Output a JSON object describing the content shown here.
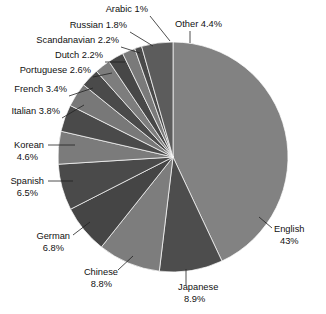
{
  "chart_data": {
    "type": "pie",
    "title": "",
    "subtitle": "",
    "xlabel": "",
    "ylabel": "",
    "legend_position": "outside-labels",
    "grid": false,
    "start_angle_deg": 0,
    "direction": "clockwise",
    "categories": [
      "English",
      "Japanese",
      "Chinese",
      "German",
      "Spanish",
      "Korean",
      "Italian",
      "French",
      "Portuguese",
      "Dutch",
      "Scandanavian",
      "Russian",
      "Arabic",
      "Other"
    ],
    "values": [
      43,
      8.9,
      8.8,
      6.8,
      6.5,
      4.6,
      3.8,
      3.4,
      2.6,
      2.2,
      2.2,
      1.8,
      1,
      4.4
    ],
    "value_unit": "%",
    "total": 100.0,
    "slices": [
      {
        "name": "English",
        "value": 43,
        "value_text": "43%",
        "label_line1": "English",
        "label_line2": "43%",
        "color": "#828282"
      },
      {
        "name": "Japanese",
        "value": 8.9,
        "value_text": "8.9%",
        "label_line1": "Japanese",
        "label_line2": "8.9%",
        "color": "#4d4d4d"
      },
      {
        "name": "Chinese",
        "value": 8.8,
        "value_text": "8.8%",
        "label_line1": "Chinese",
        "label_line2": "8.8%",
        "color": "#7d7d7d"
      },
      {
        "name": "German",
        "value": 6.8,
        "value_text": "6.8%",
        "label_line1": "German",
        "label_line2": "6.8%",
        "color": "#454545"
      },
      {
        "name": "Spanish",
        "value": 6.5,
        "value_text": "6.5%",
        "label_line1": "Spanish",
        "label_line2": "6.5%",
        "color": "#4a4a4a"
      },
      {
        "name": "Korean",
        "value": 4.6,
        "value_text": "4.6%",
        "label_line1": "Korean",
        "label_line2": "4.6%",
        "color": "#7b7b7b"
      },
      {
        "name": "Italian",
        "value": 3.8,
        "value_text": "3.8%",
        "label_line1": "Italian 3.8%",
        "label_line2": "",
        "color": "#4a4a4a"
      },
      {
        "name": "French",
        "value": 3.4,
        "value_text": "3.4%",
        "label_line1": "French 3.4%",
        "label_line2": "",
        "color": "#787878"
      },
      {
        "name": "Portuguese",
        "value": 2.6,
        "value_text": "2.6%",
        "label_line1": "Portuguese 2.6%",
        "label_line2": "",
        "color": "#4a4a4a"
      },
      {
        "name": "Dutch",
        "value": 2.2,
        "value_text": "2.2%",
        "label_line1": "Dutch 2.2%",
        "label_line2": "",
        "color": "#7d7d7d"
      },
      {
        "name": "Scandanavian",
        "value": 2.2,
        "value_text": "2.2%",
        "label_line1": "Scandanavian 2.2%",
        "label_line2": "",
        "color": "#474747"
      },
      {
        "name": "Russian",
        "value": 1.8,
        "value_text": "1.8%",
        "label_line1": "Russian 1.8%",
        "label_line2": "",
        "color": "#7a7a7a"
      },
      {
        "name": "Arabic",
        "value": 1,
        "value_text": "1%",
        "label_line1": "Arabic 1%",
        "label_line2": "",
        "color": "#4a4a4a"
      },
      {
        "name": "Other",
        "value": 4.4,
        "value_text": "4.4%",
        "label_line1": "Other 4.4%",
        "label_line2": "",
        "color": "#5c5c5c"
      }
    ]
  },
  "geometry": {
    "center_x": 173,
    "center_y": 157,
    "radius": 115
  },
  "labels": [
    {
      "key": "arabic",
      "line1": "Arabic 1%",
      "line2": "",
      "x": 148,
      "y": 12,
      "anchor": "end",
      "leader": [
        [
          150,
          16
        ],
        [
          170,
          41
        ]
      ]
    },
    {
      "key": "other",
      "line1": "Other 4.4%",
      "line2": "",
      "x": 175,
      "y": 27,
      "anchor": "start",
      "leader": [
        [
          190,
          31
        ],
        [
          190,
          43
        ]
      ]
    },
    {
      "key": "russian",
      "line1": "Russian 1.8%",
      "line2": "",
      "x": 127,
      "y": 28,
      "anchor": "end",
      "leader": [
        [
          130,
          32
        ],
        [
          153,
          46
        ]
      ]
    },
    {
      "key": "scandanavian",
      "line1": "Scandanavian 2.2%",
      "line2": "",
      "x": 119,
      "y": 43,
      "anchor": "end",
      "leader": [
        [
          121,
          47
        ],
        [
          140,
          53
        ]
      ]
    },
    {
      "key": "dutch",
      "line1": "Dutch 2.2%",
      "line2": "",
      "x": 103,
      "y": 58,
      "anchor": "end",
      "leader": [
        [
          105,
          62
        ],
        [
          125,
          62
        ]
      ]
    },
    {
      "key": "portuguese",
      "line1": "Portuguese 2.6%",
      "line2": "",
      "x": 91,
      "y": 73,
      "anchor": "end",
      "leader": [
        [
          93,
          77
        ],
        [
          112,
          73
        ]
      ]
    },
    {
      "key": "french",
      "line1": "French 3.4%",
      "line2": "",
      "x": 67,
      "y": 92,
      "anchor": "end",
      "leader": [
        [
          69,
          96
        ],
        [
          93,
          88
        ]
      ]
    },
    {
      "key": "italian",
      "line1": "Italian 3.8%",
      "line2": "",
      "x": 60,
      "y": 114,
      "anchor": "end",
      "leader": [
        [
          62,
          118
        ],
        [
          84,
          105
        ]
      ]
    },
    {
      "key": "korean",
      "line1": "Korean",
      "line2": "4.6%",
      "x": 44,
      "y": 148,
      "anchor": "end",
      "leader": [
        [
          48,
          145
        ],
        [
          75,
          145
        ]
      ]
    },
    {
      "key": "spanish",
      "line1": "Spanish",
      "line2": "6.5%",
      "x": 44,
      "y": 184,
      "anchor": "end",
      "leader": [
        [
          48,
          181
        ],
        [
          73,
          181
        ]
      ]
    },
    {
      "key": "german",
      "line1": "German",
      "line2": "6.8%",
      "x": 70,
      "y": 239,
      "anchor": "end",
      "leader": [
        [
          73,
          235
        ],
        [
          90,
          222
        ]
      ]
    },
    {
      "key": "chinese",
      "line1": "Chinese",
      "line2": "8.8%",
      "x": 118,
      "y": 275,
      "anchor": "end",
      "leader": [
        [
          118,
          270
        ],
        [
          133,
          256
        ]
      ]
    },
    {
      "key": "japanese",
      "line1": "Japanese",
      "line2": "8.9%",
      "x": 178,
      "y": 290,
      "anchor": "start",
      "leader": [
        [
          186,
          285
        ],
        [
          186,
          269
        ]
      ]
    },
    {
      "key": "english",
      "line1": "English",
      "line2": "43%",
      "x": 274,
      "y": 232,
      "anchor": "start",
      "leader": [
        [
          272,
          228
        ],
        [
          259,
          217
        ]
      ]
    }
  ]
}
